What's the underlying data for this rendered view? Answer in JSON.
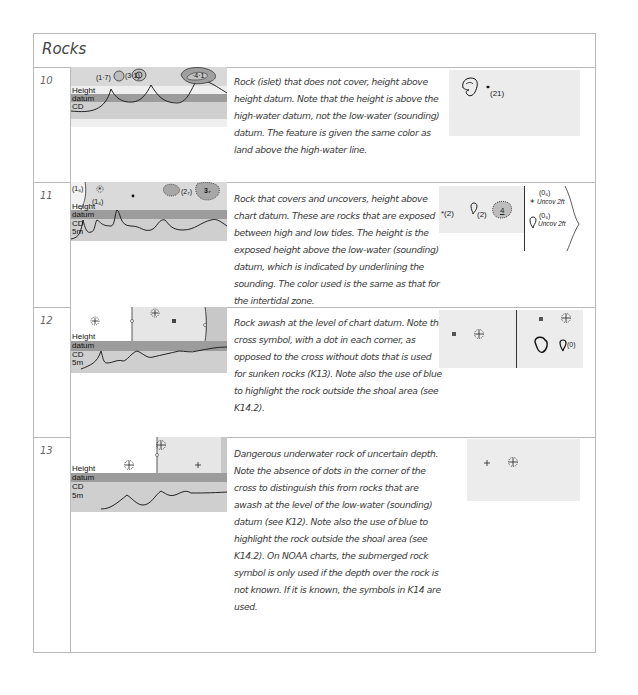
{
  "section": {
    "title": "Rocks"
  },
  "rows": [
    {
      "number": "10",
      "diagram": {
        "labels": [
          "Height",
          "datum",
          "CD"
        ],
        "soundings": [
          "(1·7)",
          "(3·1)",
          "·4·1"
        ]
      },
      "description": "Rock (islet) that does not cover, height above height datum. Note that the height is above the high-water datum, not the low-water (sounding) datum. The feature is given the same color as land above the high-water line.",
      "symbols": {
        "left": [
          "(21)"
        ]
      }
    },
    {
      "number": "11",
      "diagram": {
        "labels": [
          "Height",
          "datum",
          "CD",
          "5m"
        ],
        "soundings": [
          "(1₆)",
          "(1₆)",
          "(2₇)",
          "3₇"
        ]
      },
      "description": "Rock that covers and uncovers, height above chart datum. These are rocks that are exposed between high and low tides. The height is the exposed height above the low-water (sounding) datum, which is indicated by underlining the sounding. The color used is the same as that for the intertidal zone.",
      "symbols": {
        "left": [
          "*(2)",
          "(2)",
          "4"
        ],
        "right": [
          "(0₆)",
          "Uncov 2ft",
          "(0₆)",
          "Uncov 2ft"
        ]
      }
    },
    {
      "number": "12",
      "diagram": {
        "labels": [
          "Height",
          "datum",
          "CD",
          "5m"
        ]
      },
      "description": "Rock awash at the level of chart datum. Note the cross symbol, with a dot in each corner, as opposed to the cross without dots that is used for sunken rocks (K13). Note also the use of blue to highlight the rock outside the shoal area (see K14.2).",
      "symbols": {
        "right": [
          "(0)"
        ]
      }
    },
    {
      "number": "13",
      "diagram": {
        "labels": [
          "Height",
          "datum",
          "CD",
          "5m"
        ]
      },
      "description": "Dangerous underwater rock of uncertain depth. Note the absence of dots in the corner of the cross to distinguish this from rocks that are awash at the level of the low-water (sounding) datum (see K12). Note also the use of blue to highlight the rock outside the shoal area (see K14.2). On NOAA charts, the submerged rock symbol is only used if the depth over the rock is not known. If it is known, the symbols in K14 are used."
    }
  ],
  "colors": {
    "border": "#b9b9b9",
    "land": "#e4e4e4",
    "datum_band": "#9c9c9c",
    "intertidal": "#cfcfcf",
    "symbol_bg": "#ececec"
  }
}
